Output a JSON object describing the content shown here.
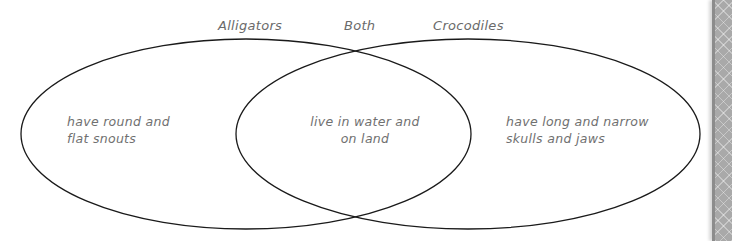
{
  "diagram": {
    "type": "venn",
    "headers": {
      "left": "Alligators",
      "middle": "Both",
      "right": "Crocodiles"
    },
    "regions": {
      "left": "have round and\nflat snouts",
      "middle": "live in water and\non land",
      "right": "have long and narrow\nskulls and jaws"
    },
    "colors": {
      "outline": "#1a1a1a",
      "text": "#6a6a6a",
      "sidebar": "#a9a9a9"
    }
  }
}
